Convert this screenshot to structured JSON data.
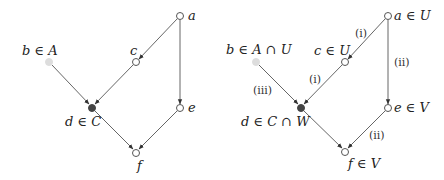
{
  "diagrams": [
    {
      "name": "left-graph",
      "nodes": {
        "a": {
          "label": "a",
          "x": 180,
          "y": 16,
          "style": "open"
        },
        "b": {
          "label": "b ∈ A",
          "x": 49,
          "y": 62,
          "style": "light"
        },
        "c": {
          "label": "c",
          "x": 136,
          "y": 62,
          "style": "open"
        },
        "d": {
          "label": "d ∈ C",
          "x": 92,
          "y": 108,
          "style": "filled"
        },
        "e": {
          "label": "e",
          "x": 180,
          "y": 108,
          "style": "open"
        },
        "f": {
          "label": "f",
          "x": 136,
          "y": 153,
          "style": "open"
        }
      },
      "edges": [
        {
          "from": "a",
          "to": "c",
          "label": ""
        },
        {
          "from": "a",
          "to": "e",
          "label": ""
        },
        {
          "from": "b",
          "to": "d",
          "label": ""
        },
        {
          "from": "c",
          "to": "d",
          "label": ""
        },
        {
          "from": "d",
          "to": "f",
          "label": ""
        },
        {
          "from": "e",
          "to": "f",
          "label": ""
        }
      ]
    },
    {
      "name": "right-graph",
      "nodes": {
        "a": {
          "label": "a ∈ U",
          "x": 388,
          "y": 16,
          "style": "open"
        },
        "b": {
          "label": "b ∈ A ∩ U",
          "x": 256,
          "y": 62,
          "style": "light"
        },
        "c": {
          "label": "c ∈ U",
          "x": 345,
          "y": 62,
          "style": "open"
        },
        "d": {
          "label": "d ∈ C ∩ W",
          "x": 301,
          "y": 108,
          "style": "filled"
        },
        "e": {
          "label": "e ∈ V",
          "x": 388,
          "y": 108,
          "style": "open"
        },
        "f": {
          "label": "f ∈ V",
          "x": 345,
          "y": 152,
          "style": "open"
        }
      },
      "edges": [
        {
          "from": "a",
          "to": "c",
          "label": "(i)"
        },
        {
          "from": "a",
          "to": "e",
          "label": "(ii)"
        },
        {
          "from": "b",
          "to": "d",
          "label": "(iii)"
        },
        {
          "from": "c",
          "to": "d",
          "label": "(i)"
        },
        {
          "from": "d",
          "to": "f",
          "label": ""
        },
        {
          "from": "e",
          "to": "f",
          "label": "(ii)"
        }
      ]
    }
  ]
}
